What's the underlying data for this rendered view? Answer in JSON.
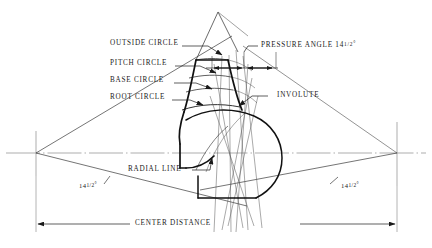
{
  "diagram": {
    "ink_color": "#1a1a1a",
    "thin_color": "#555555",
    "background": "#ffffff",
    "labels": {
      "outside_circle": "OUTSIDE CIRCLE",
      "pitch_circle": "PITCH CIRCLE",
      "base_circle": "BASE CIRCLE",
      "root_circle": "ROOT CIRCLE",
      "pressure_angle": "PRESSURE ANGLE 14",
      "pressure_angle_fraction": "1/2",
      "involute": "INVOLUTE",
      "radial_line": "RADIAL LINE",
      "center_distance": "CENTER DISTANCE",
      "angle_left": "14",
      "angle_left_fraction": "1/2",
      "angle_right": "14",
      "angle_right_fraction": "1/2",
      "degree_symbol": "°"
    },
    "values": {
      "pressure_angle_degrees": 14.5,
      "left_angle_degrees": 14.5,
      "right_angle_degrees": 14.5
    }
  }
}
